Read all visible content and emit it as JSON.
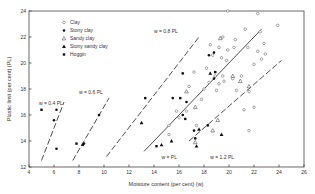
{
  "chart_data": {
    "type": "scatter",
    "title": "",
    "xlabel": "Moisture content (per cent) (w)",
    "ylabel": "Plastic limit (per cent) (PL)",
    "xlim": [
      4,
      26
    ],
    "ylim": [
      12,
      24
    ],
    "xticks": [
      4,
      6,
      8,
      10,
      12,
      14,
      16,
      18,
      20,
      22,
      24,
      26
    ],
    "yticks": [
      12,
      14,
      16,
      18,
      20,
      22,
      24
    ],
    "grid": false,
    "legend_position": "upper-left",
    "legend": [
      {
        "label": "Clay",
        "marker": "open-circle"
      },
      {
        "label": "Stony clay",
        "marker": "filled-circle"
      },
      {
        "label": "Sandy clay",
        "marker": "open-triangle"
      },
      {
        "label": "Stony sandy clay",
        "marker": "filled-triangle"
      },
      {
        "label": "Hoggin",
        "marker": "filled-square"
      }
    ],
    "reference_lines": [
      {
        "label": "w = 0.4 PL",
        "k": 0.4,
        "style": "dashed",
        "from": [
          5.0,
          12.5
        ],
        "to": [
          6.8,
          17.0
        ],
        "label_pos": [
          4.8,
          16.8
        ]
      },
      {
        "label": "w = 0.6 PL",
        "k": 0.6,
        "style": "dashed",
        "from": [
          7.5,
          12.5
        ],
        "to": [
          10.4,
          17.3
        ],
        "label_pos": [
          8.0,
          17.6
        ]
      },
      {
        "label": "w = 0.8 PL",
        "k": 0.8,
        "style": "dashed",
        "from": [
          10.2,
          12.8
        ],
        "to": [
          17.6,
          22.0
        ],
        "label_pos": [
          14.0,
          22.3
        ]
      },
      {
        "label": "w = PL",
        "k": 1.0,
        "style": "solid",
        "from": [
          13.2,
          13.2
        ],
        "to": [
          22.6,
          22.6
        ],
        "label_pos": [
          14.6,
          12.6
        ]
      },
      {
        "label": "w = 1.2 PL",
        "k": 1.2,
        "style": "dashed",
        "from": [
          16.8,
          14.0
        ],
        "to": [
          24.2,
          20.2
        ],
        "label_pos": [
          18.5,
          12.6
        ]
      }
    ],
    "series": [
      {
        "name": "Clay",
        "marker": "open-circle",
        "points": [
          [
            19.9,
            24.0
          ],
          [
            22.3,
            23.8
          ],
          [
            23.9,
            22.9
          ],
          [
            21.3,
            22.6
          ],
          [
            22.5,
            22.4
          ],
          [
            19.5,
            22.0
          ],
          [
            20.5,
            21.8
          ],
          [
            22.8,
            21.5
          ],
          [
            18.5,
            21.4
          ],
          [
            19.2,
            21.2
          ],
          [
            19.9,
            21.0
          ],
          [
            20.4,
            21.2
          ],
          [
            21.5,
            21.2
          ],
          [
            22.3,
            20.9
          ],
          [
            22.9,
            20.7
          ],
          [
            18.7,
            20.6
          ],
          [
            19.4,
            20.4
          ],
          [
            19.8,
            20.2
          ],
          [
            22.6,
            20.3
          ],
          [
            22.0,
            19.9
          ],
          [
            18.2,
            19.6
          ],
          [
            17.2,
            19.3
          ],
          [
            18.9,
            19.0
          ],
          [
            19.5,
            19.0
          ],
          [
            20.3,
            18.8
          ],
          [
            21.0,
            19.0
          ],
          [
            18.4,
            18.5
          ],
          [
            19.2,
            18.4
          ],
          [
            19.6,
            18.6
          ],
          [
            16.8,
            18.2
          ],
          [
            18.0,
            18.0
          ],
          [
            19.0,
            17.9
          ],
          [
            20.6,
            17.9
          ],
          [
            21.6,
            17.8
          ],
          [
            17.8,
            17.2
          ],
          [
            15.8,
            16.3
          ],
          [
            16.6,
            16.3
          ],
          [
            16.0,
            15.8
          ],
          [
            17.4,
            15.2
          ],
          [
            21.2,
            16.4
          ],
          [
            22.0,
            16.6
          ],
          [
            21.6,
            14.8
          ],
          [
            15.2,
            15.2
          ],
          [
            15.2,
            14.5
          ]
        ]
      },
      {
        "name": "Stony clay",
        "marker": "filled-circle",
        "points": [
          [
            6.2,
            16.4
          ],
          [
            6.0,
            15.6
          ],
          [
            6.2,
            13.4
          ],
          [
            9.6,
            16.0
          ],
          [
            8.4,
            13.8
          ],
          [
            18.4,
            20.6
          ],
          [
            18.8,
            20.8
          ],
          [
            16.3,
            19.2
          ],
          [
            18.8,
            18.8
          ],
          [
            15.5,
            17.3
          ],
          [
            16.6,
            17.0
          ],
          [
            16.3,
            16.0
          ],
          [
            17.2,
            14.8
          ],
          [
            18.3,
            15.2
          ],
          [
            17.3,
            14.2
          ]
        ]
      },
      {
        "name": "Sandy clay",
        "marker": "open-triangle",
        "points": [
          [
            19.3,
            21.9
          ],
          [
            20.3,
            19.0
          ],
          [
            20.9,
            18.6
          ],
          [
            18.7,
            14.8
          ],
          [
            19.1,
            15.6
          ],
          [
            16.6,
            17.8
          ],
          [
            17.3,
            16.6
          ],
          [
            21.6,
            18.2
          ],
          [
            17.3,
            13.9
          ]
        ]
      },
      {
        "name": "Stony sandy clay",
        "marker": "filled-triangle",
        "points": [
          [
            13.0,
            15.4
          ],
          [
            14.6,
            13.7
          ],
          [
            15.4,
            14.0
          ],
          [
            17.6,
            14.9
          ],
          [
            17.4,
            13.6
          ],
          [
            19.4,
            14.5
          ],
          [
            18.5,
            19.2
          ]
        ]
      },
      {
        "name": "Hoggin",
        "marker": "filled-square",
        "points": [
          [
            5.0,
            16.4
          ],
          [
            7.8,
            13.8
          ],
          [
            8.3,
            13.7
          ],
          [
            13.3,
            17.3
          ],
          [
            16.1,
            17.3
          ],
          [
            18.9,
            19.3
          ],
          [
            16.5,
            15.7
          ],
          [
            14.2,
            13.6
          ]
        ]
      }
    ]
  }
}
